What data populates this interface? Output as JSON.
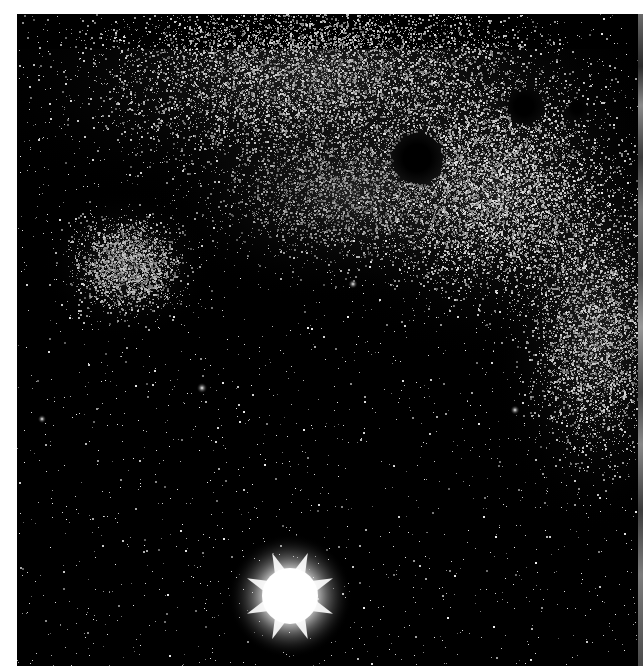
{
  "image": {
    "subject": "Black-and-white astronomical photograph of a dense Milky Way star field",
    "alt": "Star field with dark nebulae in the upper right and a bright diffraction-spiked star near the bottom center",
    "frame": {
      "x": 17,
      "y": 14,
      "width": 622,
      "height": 652
    },
    "colors": {
      "page": "#ffffff",
      "sky": "#000000",
      "star": "#ffffff",
      "edge_strip": "#6a6a6a"
    }
  },
  "starfield": {
    "seed": 1337,
    "background_star_count": 2200,
    "dense_regions": [
      {
        "name": "upper-band",
        "cx": 300,
        "cy": 60,
        "rx": 360,
        "ry": 150,
        "count": 9000,
        "brightness": 0.85
      },
      {
        "name": "upper-right-cloud",
        "cx": 480,
        "cy": 180,
        "rx": 200,
        "ry": 170,
        "count": 7000,
        "brightness": 0.9
      },
      {
        "name": "left-glow",
        "cx": 110,
        "cy": 250,
        "rx": 85,
        "ry": 75,
        "count": 2600,
        "brightness": 0.8
      },
      {
        "name": "right-band",
        "cx": 580,
        "cy": 320,
        "rx": 110,
        "ry": 200,
        "count": 4200,
        "brightness": 0.85
      },
      {
        "name": "center-mid",
        "cx": 330,
        "cy": 180,
        "rx": 200,
        "ry": 110,
        "count": 3200,
        "brightness": 0.7
      }
    ],
    "dark_nebulae": [
      {
        "name": "dark-nebula-large",
        "cx": 400,
        "cy": 144,
        "r": 25
      },
      {
        "name": "dark-nebula-upper",
        "cx": 507,
        "cy": 92,
        "r": 17
      },
      {
        "name": "dark-nebula-small",
        "cx": 560,
        "cy": 94,
        "r": 9
      }
    ],
    "bright_stars": [
      {
        "name": "bright-star-main",
        "cx": 273,
        "cy": 582,
        "core": 28,
        "halo": 62,
        "spikes": 8
      },
      {
        "name": "bright-star-left",
        "cx": 185,
        "cy": 374,
        "core": 2.5
      },
      {
        "name": "bright-star-mid",
        "cx": 336,
        "cy": 270,
        "core": 2.2
      },
      {
        "name": "bright-star-right",
        "cx": 498,
        "cy": 396,
        "core": 2.2
      },
      {
        "name": "bright-star-edge",
        "cx": 25,
        "cy": 405,
        "core": 2.0
      }
    ]
  }
}
